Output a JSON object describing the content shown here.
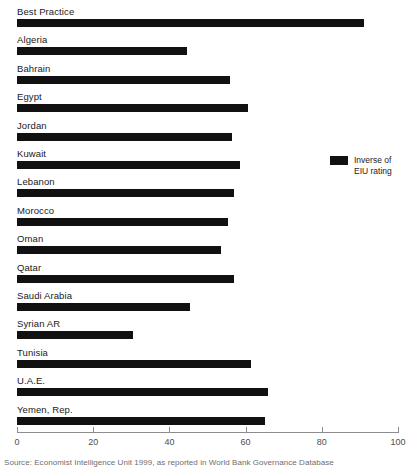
{
  "chart_data": {
    "type": "bar",
    "orientation": "horizontal",
    "title": "",
    "xlabel": "",
    "ylabel": "",
    "xlim": [
      0,
      100
    ],
    "xticks": [
      0,
      20,
      40,
      60,
      80,
      100
    ],
    "grid": false,
    "legend_position": "right",
    "series": [
      {
        "name": "Inverse of EIU rating",
        "color": "#111111",
        "values": [
          91,
          44.5,
          56,
          60.5,
          56.5,
          58.5,
          57,
          55.5,
          53.5,
          57,
          45.5,
          30.5,
          61.5,
          66,
          65
        ]
      }
    ],
    "categories": [
      "Best Practice",
      "Algeria",
      "Bahrain",
      "Egypt",
      "Jordan",
      "Kuwait",
      "Lebanon",
      "Morocco",
      "Oman",
      "Qatar",
      "Saudi Arabia",
      "Syrian AR",
      "Tunisia",
      "U.A.E.",
      "Yemen, Rep."
    ]
  },
  "legend": {
    "line1": "Inverse of",
    "line2": "EIU rating"
  },
  "caption": "Source: Economist Intelligence Unit 1999, as reported in World Bank Governance Database",
  "colors": {
    "bar": "#111111",
    "axis": "#8c8c8c",
    "label": "#1a1a1a",
    "caption": "#6e6e6e"
  }
}
